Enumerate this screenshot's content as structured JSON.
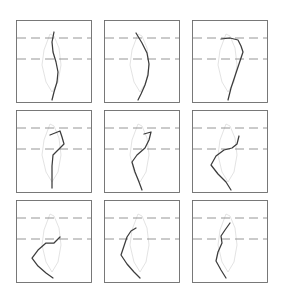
{
  "figure": {
    "title": "",
    "background_color": "#ffffff",
    "width": 285,
    "height": 297,
    "grid": {
      "rows": 3,
      "cols": 3,
      "panel_width": 76,
      "panel_height": 83
    }
  },
  "style": {
    "frame_color": "#6b6b6b",
    "guide_line_color": "#8a8a8a",
    "guide_line_dash": "9 5",
    "reference_shape_color": "#dcdcdc",
    "trajectory_color": "#3c3c3c"
  },
  "chart_data": {
    "type": "line",
    "title": "",
    "xlabel": "",
    "ylabel": "",
    "grid": true,
    "legend": "none",
    "xlim": [
      0,
      76
    ],
    "ylim": [
      0,
      83
    ],
    "axis_note": "Panel-local pixel coordinates; y increases downward",
    "shared_guides": {
      "horizontal_lines_y": [
        18,
        39
      ],
      "style": "dashed gray"
    },
    "shared_reference_shape": {
      "name": "reference-outline",
      "description": "faint light-gray closed lens outline repeated in every panel",
      "points": [
        [
          34,
          14
        ],
        [
          28,
          30
        ],
        [
          26,
          45
        ],
        [
          30,
          62
        ],
        [
          36,
          72
        ],
        [
          42,
          62
        ],
        [
          45,
          45
        ],
        [
          43,
          28
        ],
        [
          38,
          16
        ],
        [
          34,
          14
        ]
      ]
    },
    "panels": [
      {
        "index": 1,
        "row": 1,
        "col": 1,
        "name": "panel-r1c1",
        "series": [
          {
            "name": "trajectory",
            "points": [
              [
                38,
                12
              ],
              [
                36,
                22
              ],
              [
                37,
                32
              ],
              [
                40,
                42
              ],
              [
                42,
                52
              ],
              [
                41,
                62
              ],
              [
                38,
                72
              ],
              [
                36,
                80
              ]
            ]
          }
        ]
      },
      {
        "index": 2,
        "row": 1,
        "col": 2,
        "name": "panel-r1c2",
        "series": [
          {
            "name": "trajectory",
            "points": [
              [
                32,
                13
              ],
              [
                38,
                23
              ],
              [
                43,
                33
              ],
              [
                45,
                44
              ],
              [
                44,
                55
              ],
              [
                41,
                65
              ],
              [
                37,
                74
              ],
              [
                34,
                80
              ]
            ]
          }
        ]
      },
      {
        "index": 3,
        "row": 1,
        "col": 3,
        "name": "panel-r1c3",
        "series": [
          {
            "name": "trajectory",
            "points": [
              [
                29,
                19
              ],
              [
                38,
                18
              ],
              [
                46,
                20
              ],
              [
                49,
                26
              ],
              [
                51,
                32
              ],
              [
                47,
                44
              ],
              [
                43,
                56
              ],
              [
                39,
                68
              ],
              [
                36,
                80
              ]
            ]
          }
        ]
      },
      {
        "index": 4,
        "row": 2,
        "col": 1,
        "name": "panel-r2c1",
        "series": [
          {
            "name": "trajectory",
            "points": [
              [
                34,
                25
              ],
              [
                44,
                21
              ],
              [
                46,
                27
              ],
              [
                48,
                34
              ],
              [
                42,
                40
              ],
              [
                37,
                45
              ],
              [
                36,
                56
              ],
              [
                36,
                68
              ],
              [
                36,
                78
              ]
            ]
          }
        ]
      },
      {
        "index": 5,
        "row": 2,
        "col": 2,
        "name": "panel-r2c2",
        "series": [
          {
            "name": "trajectory",
            "points": [
              [
                40,
                24
              ],
              [
                47,
                22
              ],
              [
                45,
                30
              ],
              [
                41,
                38
              ],
              [
                33,
                45
              ],
              [
                28,
                52
              ],
              [
                31,
                62
              ],
              [
                35,
                72
              ],
              [
                38,
                80
              ]
            ]
          }
        ]
      },
      {
        "index": 6,
        "row": 2,
        "col": 3,
        "name": "panel-r2c3",
        "series": [
          {
            "name": "trajectory",
            "points": [
              [
                47,
                26
              ],
              [
                45,
                34
              ],
              [
                40,
                38
              ],
              [
                32,
                40
              ],
              [
                24,
                46
              ],
              [
                19,
                55
              ],
              [
                26,
                64
              ],
              [
                34,
                72
              ],
              [
                39,
                80
              ]
            ]
          }
        ]
      },
      {
        "index": 7,
        "row": 3,
        "col": 1,
        "name": "panel-r3c1",
        "series": [
          {
            "name": "trajectory",
            "points": [
              [
                44,
                37
              ],
              [
                38,
                43
              ],
              [
                30,
                43
              ],
              [
                22,
                50
              ],
              [
                16,
                58
              ],
              [
                22,
                66
              ],
              [
                30,
                73
              ],
              [
                37,
                78
              ]
            ]
          }
        ]
      },
      {
        "index": 8,
        "row": 3,
        "col": 2,
        "name": "panel-r3c2",
        "series": [
          {
            "name": "trajectory",
            "points": [
              [
                32,
                28
              ],
              [
                27,
                31
              ],
              [
                23,
                37
              ],
              [
                20,
                46
              ],
              [
                17,
                55
              ],
              [
                23,
                64
              ],
              [
                30,
                72
              ],
              [
                36,
                78
              ]
            ]
          }
        ]
      },
      {
        "index": 9,
        "row": 3,
        "col": 3,
        "name": "panel-r3c3",
        "series": [
          {
            "name": "trajectory",
            "points": [
              [
                38,
                23
              ],
              [
                33,
                30
              ],
              [
                29,
                36
              ],
              [
                30,
                43
              ],
              [
                26,
                52
              ],
              [
                24,
                61
              ],
              [
                29,
                70
              ],
              [
                34,
                78
              ]
            ]
          }
        ]
      }
    ]
  }
}
